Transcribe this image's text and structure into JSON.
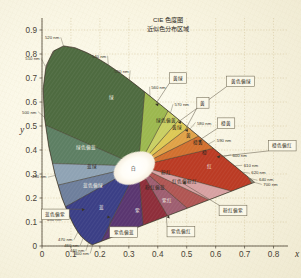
{
  "meta": {
    "bg_color": "#fbf7e4",
    "axis_color": "#4a4336",
    "grid_color": "#cdbf8f"
  },
  "title": {
    "line1": "CIE 色度图",
    "line2": "近似色分布区域"
  },
  "chart_data": {
    "type": "scatter",
    "xlabel": "x",
    "ylabel": "y",
    "xlim": [
      0,
      0.85
    ],
    "ylim": [
      0,
      0.95
    ],
    "grid": true,
    "legend": "none",
    "x_ticks": [
      "0",
      "0.1",
      "0.2",
      "0.3",
      "0.4",
      "0.5",
      "0.6",
      "0.7",
      "0.8"
    ],
    "x_tick_values": [
      0,
      0.1,
      0.2,
      0.3,
      0.4,
      0.5,
      0.6,
      0.7,
      0.8
    ],
    "y_ticks": [
      "0",
      "0.1",
      "0.2",
      "0.3",
      "0.4",
      "0.5",
      "0.6",
      "0.7",
      "0.8",
      "0.9"
    ],
    "y_tick_values": [
      0,
      0.1,
      0.2,
      0.3,
      0.4,
      0.5,
      0.6,
      0.7,
      0.8,
      0.9
    ],
    "white_point": {
      "label": "白",
      "x": 0.333,
      "y": 0.333
    },
    "spectral_locus_labels": [
      {
        "text": "520 nm",
        "x": 0.074,
        "y": 0.834
      },
      {
        "text": "540 nm",
        "x": 0.229,
        "y": 0.754
      },
      {
        "text": "550 nm",
        "x": 0.302,
        "y": 0.692
      },
      {
        "text": "560 nm",
        "x": 0.373,
        "y": 0.624
      },
      {
        "text": "570 nm",
        "x": 0.444,
        "y": 0.555
      },
      {
        "text": "580 nm",
        "x": 0.512,
        "y": 0.488
      },
      {
        "text": "590 nm",
        "x": 0.575,
        "y": 0.425
      },
      {
        "text": "600 nm",
        "x": 0.627,
        "y": 0.373
      },
      {
        "text": "610 nm",
        "x": 0.666,
        "y": 0.334
      },
      {
        "text": "620 nm",
        "x": 0.692,
        "y": 0.308
      },
      {
        "text": "640 nm",
        "x": 0.719,
        "y": 0.281
      },
      {
        "text": "700 nm",
        "x": 0.734,
        "y": 0.265
      },
      {
        "text": "510 nm",
        "x": 0.011,
        "y": 0.75
      },
      {
        "text": "500 nm",
        "x": 0.007,
        "y": 0.538
      },
      {
        "text": "490 nm",
        "x": 0.046,
        "y": 0.294
      },
      {
        "text": "480 nm",
        "x": 0.091,
        "y": 0.136
      },
      {
        "text": "470 nm",
        "x": 0.124,
        "y": 0.058
      },
      {
        "text": "460 nm",
        "x": 0.143,
        "y": 0.035
      },
      {
        "text": "440 nm",
        "x": 0.161,
        "y": 0.015
      },
      {
        "text": "400 nm",
        "x": 0.175,
        "y": 0.005
      }
    ],
    "regions": [
      {
        "label": "绿",
        "color": "#4e6b40",
        "x": 0.24,
        "y": 0.62
      },
      {
        "label": "绿色偏黄",
        "color": "#9cb84f",
        "x": 0.43,
        "y": 0.525
      },
      {
        "label": "绿色偏蓝",
        "color": "#5d7f63",
        "x": 0.152,
        "y": 0.412
      },
      {
        "label": "蓝绿",
        "color": "#8fa3b4",
        "x": 0.172,
        "y": 0.333
      },
      {
        "label": "蓝色偏绿",
        "color": "#6e7f9c",
        "x": 0.176,
        "y": 0.254
      },
      {
        "label": "蓝",
        "color": "#3b3f86",
        "x": 0.206,
        "y": 0.162
      },
      {
        "label": "黄绿",
        "color": "#c9cf63",
        "x": 0.468,
        "y": 0.496
      },
      {
        "label": "黄",
        "color": "#ddc955",
        "x": 0.505,
        "y": 0.462
      },
      {
        "label": "橙黄",
        "color": "#e0a247",
        "x": 0.54,
        "y": 0.43
      },
      {
        "label": "橙",
        "color": "#d2702f",
        "x": 0.56,
        "y": 0.392
      },
      {
        "label": "红",
        "color": "#bb3b24",
        "x": 0.578,
        "y": 0.33
      },
      {
        "label": "红色偏粉红",
        "color": "#b05653",
        "x": 0.492,
        "y": 0.268
      },
      {
        "label": "粉红",
        "color": "#d7a1a2",
        "x": 0.428,
        "y": 0.306
      },
      {
        "label": "粉红偏蓝",
        "color": "#9e5e70",
        "x": 0.391,
        "y": 0.244
      },
      {
        "label": "紫红",
        "color": "#8e2e3a",
        "x": 0.433,
        "y": 0.192
      },
      {
        "label": "紫",
        "color": "#5a3670",
        "x": 0.33,
        "y": 0.15
      },
      {
        "label": "白",
        "color": "#ffffff",
        "x": 0.333,
        "y": 0.333
      }
    ],
    "callouts": [
      {
        "label": "黄绿",
        "box_x": 0.47,
        "box_y": 0.7,
        "tip_x": 0.392,
        "tip_y": 0.59
      },
      {
        "label": "黄色偏绿",
        "box_x": 0.686,
        "box_y": 0.686,
        "tip_x": 0.47,
        "tip_y": 0.516
      },
      {
        "label": "黄",
        "box_x": 0.556,
        "box_y": 0.596,
        "tip_x": 0.494,
        "tip_y": 0.482
      },
      {
        "label": "橙黄",
        "box_x": 0.636,
        "box_y": 0.512,
        "tip_x": 0.54,
        "tip_y": 0.438
      },
      {
        "label": "橙色偏红",
        "box_x": 0.83,
        "box_y": 0.418,
        "tip_x": 0.604,
        "tip_y": 0.372
      },
      {
        "label": "粉红偏紫",
        "box_x": 0.66,
        "box_y": 0.148,
        "tip_x": 0.486,
        "tip_y": 0.262
      },
      {
        "label": "紫色偏红",
        "box_x": 0.48,
        "box_y": 0.06,
        "tip_x": 0.43,
        "tip_y": 0.12
      },
      {
        "label": "紫色偏蓝",
        "box_x": 0.282,
        "box_y": 0.058,
        "tip_x": 0.236,
        "tip_y": 0.12
      },
      {
        "label": "蓝色偏紫",
        "box_x": 0.046,
        "box_y": 0.132,
        "tip_x": 0.148,
        "tip_y": 0.152
      }
    ]
  }
}
